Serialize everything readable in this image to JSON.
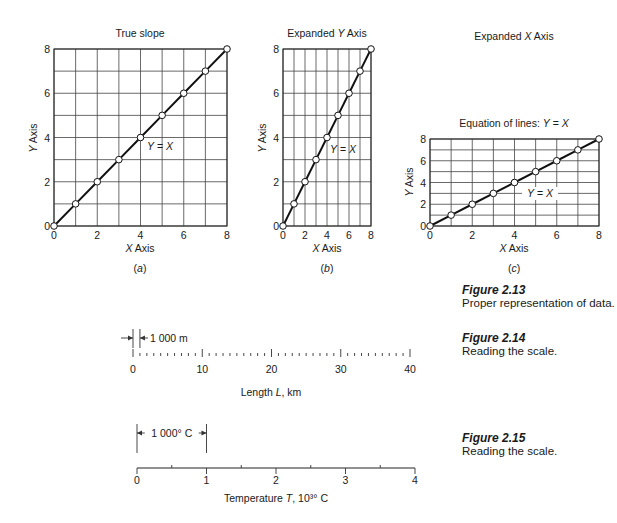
{
  "chart_data": [
    {
      "type": "line",
      "panel_label": "(a)",
      "title": "True slope",
      "xlabel": "X Axis",
      "ylabel": "Y Axis",
      "annotation": "Y = X",
      "x": [
        0,
        1,
        2,
        3,
        4,
        5,
        6,
        7,
        8
      ],
      "y": [
        0,
        1,
        2,
        3,
        4,
        5,
        6,
        7,
        8
      ],
      "xlim": [
        0,
        8
      ],
      "ylim": [
        0,
        8
      ],
      "xticks": [
        "0",
        "2",
        "4",
        "6",
        "8"
      ],
      "yticks": [
        "0",
        "2",
        "4",
        "6",
        "8"
      ],
      "grid": true
    },
    {
      "type": "line",
      "panel_label": "(b)",
      "title": "Expanded Y Axis",
      "xlabel": "X Axis",
      "ylabel": "Y Axis",
      "annotation": "Y = X",
      "x": [
        0,
        1,
        2,
        3,
        4,
        5,
        6,
        7,
        8
      ],
      "y": [
        0,
        1,
        2,
        3,
        4,
        5,
        6,
        7,
        8
      ],
      "xlim": [
        0,
        8
      ],
      "ylim": [
        0,
        8
      ],
      "xticks": [
        "0",
        "2",
        "4",
        "6",
        "8"
      ],
      "yticks": [
        "0",
        "2",
        "4",
        "6",
        "8"
      ],
      "grid": true
    },
    {
      "type": "line",
      "panel_label": "(c)",
      "heading": "Expanded X Axis",
      "title": "Equation of lines: Y = X",
      "xlabel": "X Axis",
      "ylabel": "Y Axis",
      "annotation": "Y = X",
      "x": [
        0,
        1,
        2,
        3,
        4,
        5,
        6,
        7,
        8
      ],
      "y": [
        0,
        1,
        2,
        3,
        4,
        5,
        6,
        7,
        8
      ],
      "xlim": [
        0,
        8
      ],
      "ylim": [
        0,
        8
      ],
      "xticks": [
        "0",
        "2",
        "4",
        "6",
        "8"
      ],
      "yticks": [
        "0",
        "2",
        "4",
        "6",
        "8"
      ],
      "grid": true
    }
  ],
  "scales": [
    {
      "name": "length",
      "label": "Length L, km",
      "range": [
        0,
        40
      ],
      "major_ticks": [
        "0",
        "10",
        "20",
        "30",
        "40"
      ],
      "major_step": 10,
      "minor_step": 1,
      "callout": "1 000 m",
      "callout_span": [
        0,
        1
      ]
    },
    {
      "name": "temperature",
      "label": "Temperature T, 10³° C",
      "range": [
        0,
        4
      ],
      "major_ticks": [
        "0",
        "1",
        "2",
        "3",
        "4"
      ],
      "major_step": 1,
      "minor_step": 0.5,
      "callout": "1 000° C",
      "callout_span": [
        0,
        1
      ]
    }
  ],
  "captions": [
    {
      "number": "Figure 2.13",
      "text": "Proper representation of data."
    },
    {
      "number": "Figure 2.14",
      "text": "Reading the scale."
    },
    {
      "number": "Figure 2.15",
      "text": "Reading the scale."
    }
  ]
}
